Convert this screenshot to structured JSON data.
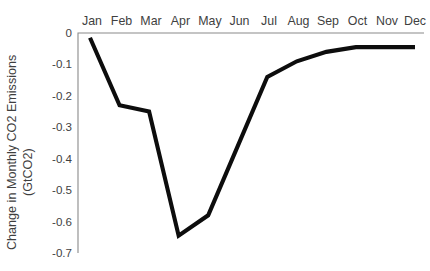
{
  "chart_data": {
    "type": "line",
    "title": "",
    "xlabel": "",
    "ylabel": "Change in Monthly CO2 Emissions (GtCO2)",
    "ylabel_line1": "Change in Monthly CO2 Emissions",
    "ylabel_line2": "(GtCO2)",
    "categories": [
      "Jan",
      "Feb",
      "Mar",
      "Apr",
      "May",
      "Jun",
      "Jul",
      "Aug",
      "Sep",
      "Oct",
      "Nov",
      "Dec"
    ],
    "values": [
      -0.015,
      -0.23,
      -0.25,
      -0.645,
      -0.58,
      -0.36,
      -0.14,
      -0.09,
      -0.06,
      -0.045,
      -0.045,
      -0.045
    ],
    "series": [
      {
        "name": "Change in Monthly CO2 Emissions",
        "values": [
          -0.015,
          -0.23,
          -0.25,
          -0.645,
          -0.58,
          -0.36,
          -0.14,
          -0.09,
          -0.06,
          -0.045,
          -0.045,
          -0.045
        ]
      }
    ],
    "ylim": [
      -0.7,
      0
    ],
    "ytick_labels": [
      "0",
      "-0.1",
      "-0.2",
      "-0.3",
      "-0.4",
      "-0.5",
      "-0.6",
      "-0.7"
    ],
    "ytick_values": [
      0,
      -0.1,
      -0.2,
      -0.3,
      -0.4,
      -0.5,
      -0.6,
      -0.7
    ],
    "xtick_labels": [
      "Jan",
      "Feb",
      "Mar",
      "Apr",
      "May",
      "Jun",
      "Jul",
      "Aug",
      "Sep",
      "Oct",
      "Nov",
      "Dec"
    ],
    "grid": false,
    "legend": false,
    "legend_position": "none",
    "xaxis_position": "top",
    "line_color": "#0d0d0d",
    "axis_color": "#8a8a8a",
    "background_color": "#ffffff"
  }
}
